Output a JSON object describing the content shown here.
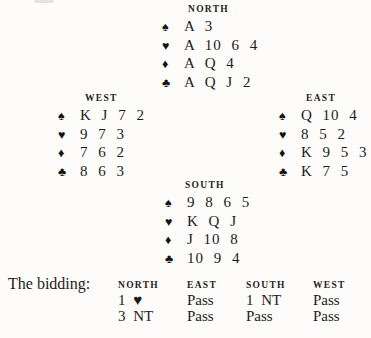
{
  "page": {
    "background_color": "#fdfcfa",
    "text_color": "#201d19"
  },
  "hands": {
    "north": {
      "label": "NORTH",
      "suits": [
        {
          "icon": "spade-icon",
          "symbol": "♠",
          "cards": "A 3"
        },
        {
          "icon": "heart-icon",
          "symbol": "♥",
          "cards": "A 10 6 4"
        },
        {
          "icon": "diamond-icon",
          "symbol": "♦",
          "cards": "A Q 4"
        },
        {
          "icon": "club-icon",
          "symbol": "♣",
          "cards": "A Q J 2"
        }
      ]
    },
    "west": {
      "label": "WEST",
      "suits": [
        {
          "icon": "spade-icon",
          "symbol": "♠",
          "cards": "K J 7 2"
        },
        {
          "icon": "heart-icon",
          "symbol": "♥",
          "cards": "9 7 3"
        },
        {
          "icon": "diamond-icon",
          "symbol": "♦",
          "cards": "7 6 2"
        },
        {
          "icon": "club-icon",
          "symbol": "♣",
          "cards": "8 6 3"
        }
      ]
    },
    "east": {
      "label": "EAST",
      "suits": [
        {
          "icon": "spade-icon",
          "symbol": "♠",
          "cards": "Q 10 4"
        },
        {
          "icon": "heart-icon",
          "symbol": "♥",
          "cards": "8 5 2"
        },
        {
          "icon": "diamond-icon",
          "symbol": "♦",
          "cards": "K 9 5 3"
        },
        {
          "icon": "club-icon",
          "symbol": "♣",
          "cards": "K 7 5"
        }
      ]
    },
    "south": {
      "label": "SOUTH",
      "suits": [
        {
          "icon": "spade-icon",
          "symbol": "♠",
          "cards": "9 8 6 5"
        },
        {
          "icon": "heart-icon",
          "symbol": "♥",
          "cards": "K Q J"
        },
        {
          "icon": "diamond-icon",
          "symbol": "♦",
          "cards": "J 10 8"
        },
        {
          "icon": "club-icon",
          "symbol": "♣",
          "cards": "10 9 4"
        }
      ]
    }
  },
  "bidding": {
    "label": "The bidding:",
    "columns": [
      {
        "header": "NORTH",
        "bids": [
          "1 ♥",
          "3 NT"
        ]
      },
      {
        "header": "EAST",
        "bids": [
          "Pass",
          "Pass"
        ]
      },
      {
        "header": "SOUTH",
        "bids": [
          "1 NT",
          "Pass"
        ]
      },
      {
        "header": "WEST",
        "bids": [
          "Pass",
          "Pass"
        ]
      }
    ]
  }
}
